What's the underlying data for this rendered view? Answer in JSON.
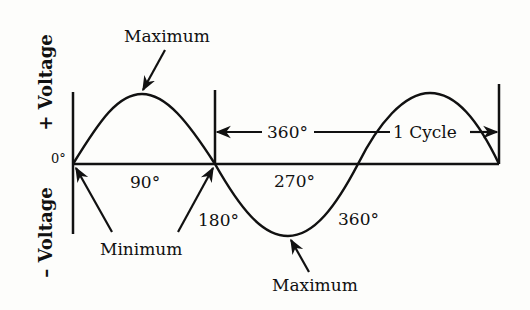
{
  "diagram": {
    "type": "ac-sine-wave",
    "axis_labels": {
      "positive": "+ Voltage",
      "negative": "– Voltage",
      "origin": "0°"
    },
    "annotations": {
      "top_maximum": "Maximum",
      "bottom_maximum": "Maximum",
      "minimum": "Minimum",
      "cycle_span_degrees": "360°",
      "cycle_label": "1 Cycle"
    },
    "angle_labels": {
      "deg90": "90°",
      "deg180": "180°",
      "deg270": "270°",
      "deg360": "360°"
    },
    "colors": {
      "ink": "#111111",
      "paper": "#fdfdfb"
    }
  }
}
